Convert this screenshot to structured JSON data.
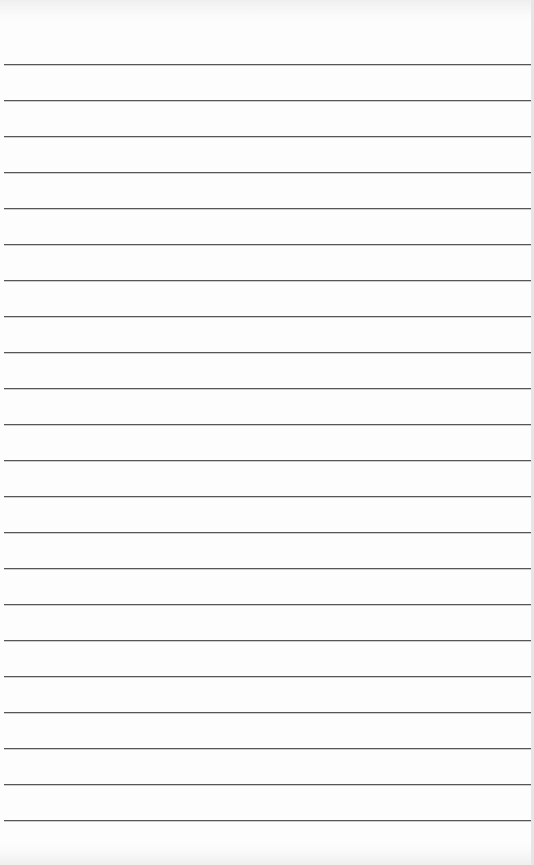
{
  "paper": {
    "type": "lined-paper",
    "line_color": "#555555",
    "background": "#fdfdfd",
    "line_count": 22,
    "first_line_y": 64,
    "line_spacing": 36
  }
}
